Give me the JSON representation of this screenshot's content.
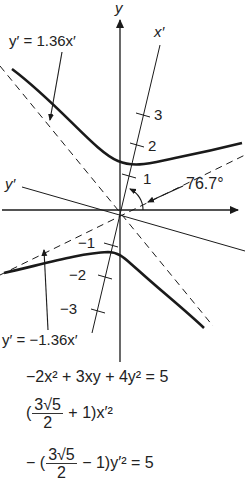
{
  "axes": {
    "x_label": "x",
    "y_label": "y",
    "x_prime_label": "x′",
    "y_prime_label": "y′"
  },
  "ticks": {
    "positive": [
      "1",
      "2",
      "3"
    ],
    "negative": [
      "−1",
      "−2",
      "−3"
    ]
  },
  "annotations": {
    "asymptote_upper": "y′ = 1.36x′",
    "asymptote_lower": "y′ = −1.36x′",
    "rotation_angle": "76.7°"
  },
  "equations": {
    "original": "−2x² + 3xy + 4y² = 5",
    "rotated_line1_prefix": "(",
    "rotated_line1_num": "3√5",
    "rotated_line1_den": "2",
    "rotated_line1_suffix": "+ 1)x′²",
    "rotated_line2_prefix": "− (",
    "rotated_line2_num": "3√5",
    "rotated_line2_den": "2",
    "rotated_line2_suffix": "− 1)y′² = 5"
  },
  "colors": {
    "ink": "#1a1a1a",
    "background": "#ffffff"
  }
}
